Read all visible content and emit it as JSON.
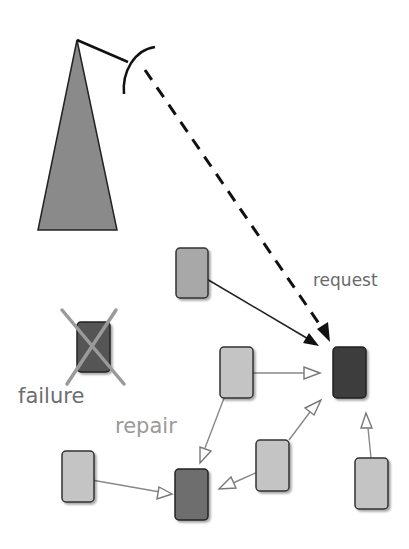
{
  "labels": {
    "request": "request",
    "failure": "failure",
    "repair": "repair"
  },
  "colors": {
    "tower_fill": "#8a8a8a",
    "node_light": "#c4c4c4",
    "node_medium": "#a8a8a8",
    "node_dark": "#3c3c3c",
    "node_repair": "#6e6e6e",
    "node_failed": "#555555",
    "x_mark": "#9a9a9a",
    "label_text": "#8c8c8c",
    "failure_text": "#6e6e6e",
    "request_text": "#6a6a6a",
    "edge_dark": "#222222",
    "edge_light": "#888888"
  },
  "nodes": [
    {
      "id": "node-a",
      "role": "relay",
      "shade": "node_medium"
    },
    {
      "id": "node-target",
      "role": "request-target",
      "shade": "node_dark"
    },
    {
      "id": "node-failed",
      "role": "failed",
      "shade": "node_failed"
    },
    {
      "id": "node-b",
      "role": "neighbor",
      "shade": "node_light"
    },
    {
      "id": "node-c",
      "role": "neighbor",
      "shade": "node_light"
    },
    {
      "id": "node-repair",
      "role": "repair",
      "shade": "node_repair"
    },
    {
      "id": "node-e",
      "role": "neighbor",
      "shade": "node_light"
    },
    {
      "id": "node-f",
      "role": "neighbor",
      "shade": "node_light"
    }
  ],
  "edges": [
    {
      "from": "tower",
      "to": "node-target",
      "style": "dashed-solid-head"
    },
    {
      "from": "node-a",
      "to": "node-target",
      "style": "solid-filled-head"
    },
    {
      "from": "node-b",
      "to": "node-target",
      "style": "open-head"
    },
    {
      "from": "node-e",
      "to": "node-target",
      "style": "open-head"
    },
    {
      "from": "node-f",
      "to": "node-target",
      "style": "open-head"
    },
    {
      "from": "node-b",
      "to": "node-repair",
      "style": "open-head"
    },
    {
      "from": "node-c",
      "to": "node-repair",
      "style": "open-head"
    },
    {
      "from": "node-e",
      "to": "node-repair",
      "style": "open-head"
    }
  ]
}
